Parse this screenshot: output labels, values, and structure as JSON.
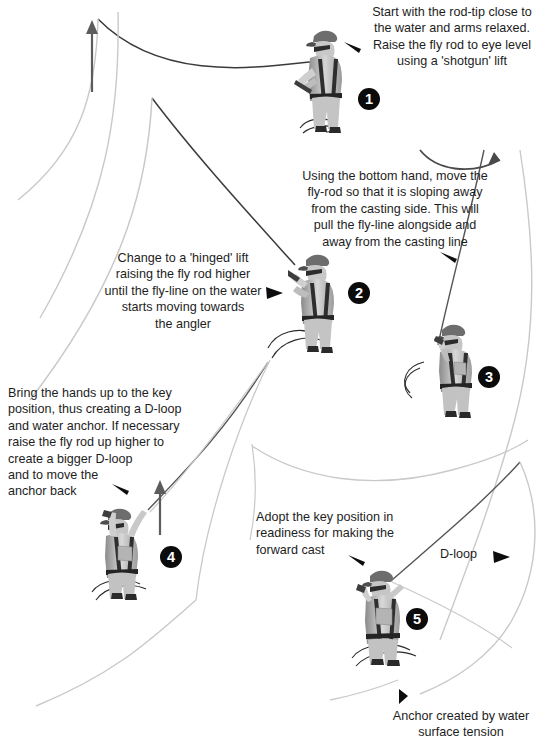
{
  "diagram": {
    "background_color": "#ffffff",
    "ink_color": "#1d1d1d",
    "fly_line_color": "#c9c9c9",
    "rod_color": "#3a3a3a",
    "badge_color": "#0b0b0b",
    "badge_text_color": "#ffffff"
  },
  "steps": [
    {
      "number": "1",
      "text": "Start with the rod-tip close to\nthe water and arms relaxed.\nRaise the fly rod to eye level\nusing a 'shotgun' lift",
      "pointer": "triangle-left",
      "align": "right"
    },
    {
      "number": "2",
      "text": "Change to a 'hinged' lift\nraising the fly rod higher\nuntil the fly-line on the water\nstarts moving towards\nthe angler",
      "pointer": "triangle-right",
      "align": "center"
    },
    {
      "number": "3",
      "text": "Using the bottom hand, move the\nfly-rod so that it is sloping away\nfrom the casting side. This will\npull the fly-line alongside and\naway from the casting line",
      "pointer": "triangle-left",
      "align": "center"
    },
    {
      "number": "4",
      "text": "Bring the hands up to the key\nposition, thus creating a D-loop\nand water anchor. If necessary\nraise the fly rod up higher to\ncreate a bigger D-loop\nand to move the\nanchor back",
      "pointer": "triangle-left",
      "align": "left"
    },
    {
      "number": "5",
      "text": "Adopt the key position in\nreadiness for making the\nforward cast",
      "pointer": "triangle-left",
      "align": "left"
    }
  ],
  "annotations": {
    "d_loop_label": "D-loop",
    "d_loop_pointer": "triangle-right",
    "anchor_label": "Anchor created by water\nsurface tension",
    "anchor_pointer": "triangle-right-small"
  },
  "icons": {
    "up_arrow_1": "arrow-up-icon",
    "up_arrow_2": "arrow-up-icon",
    "curved_arrow": "curved-arrow-right-icon"
  }
}
